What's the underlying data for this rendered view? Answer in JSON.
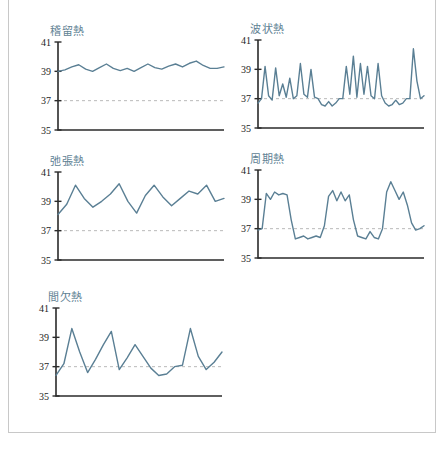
{
  "page": {
    "background_color": "#ffffff",
    "border_color": "#c8c8c8",
    "line_color": "#5a7f94",
    "title_color": "#5f8294",
    "axis_color": "#2b2b2b",
    "reference_line_color": "#b9b9b9"
  },
  "chart_data": [
    {
      "type": "line",
      "title": "稽留熱",
      "xlabel": "",
      "ylabel": "",
      "ylim": [
        35,
        41
      ],
      "yticks": [
        35,
        37,
        39,
        41
      ],
      "ytick_labels": [
        "35",
        "37",
        "39",
        "41"
      ],
      "grid": false,
      "legend": "none",
      "reference_line": 37,
      "series": [
        {
          "name": "体温",
          "values": [
            39.0,
            39.1,
            39.3,
            39.45,
            39.15,
            39.0,
            39.25,
            39.5,
            39.2,
            39.05,
            39.2,
            39.0,
            39.25,
            39.5,
            39.25,
            39.15,
            39.35,
            39.5,
            39.3,
            39.55,
            39.7,
            39.4,
            39.2,
            39.2,
            39.3
          ]
        }
      ]
    },
    {
      "type": "line",
      "title": "波状熱",
      "xlabel": "",
      "ylabel": "",
      "ylim": [
        35,
        41
      ],
      "yticks": [
        35,
        37,
        39,
        41
      ],
      "ytick_labels": [
        "35",
        "37",
        "39",
        "41"
      ],
      "grid": false,
      "legend": "none",
      "reference_line": 37,
      "series": [
        {
          "name": "体温",
          "values": [
            36.7,
            37.0,
            39.2,
            37.2,
            36.9,
            39.1,
            37.2,
            38.0,
            37.1,
            38.4,
            37.0,
            37.2,
            39.4,
            37.3,
            37.1,
            39.0,
            37.1,
            37.0,
            36.6,
            36.5,
            36.8,
            36.5,
            36.7,
            37.0,
            37.0,
            39.2,
            37.3,
            39.9,
            37.1,
            39.4,
            37.3,
            39.2,
            37.2,
            37.0,
            39.4,
            37.2,
            36.7,
            36.5,
            36.6,
            36.9,
            36.6,
            36.7,
            37.0,
            37.0,
            40.4,
            38.2,
            37.0,
            37.2
          ]
        }
      ]
    },
    {
      "type": "line",
      "title": "弛張熱",
      "xlabel": "",
      "ylabel": "",
      "ylim": [
        35,
        41
      ],
      "yticks": [
        35,
        37,
        39,
        41
      ],
      "ytick_labels": [
        "35",
        "37",
        "39",
        "41"
      ],
      "grid": false,
      "legend": "none",
      "reference_line": 37,
      "series": [
        {
          "name": "体温",
          "values": [
            38.1,
            38.8,
            40.1,
            39.2,
            38.6,
            39.0,
            39.5,
            40.2,
            39.0,
            38.2,
            39.4,
            40.1,
            39.3,
            38.7,
            39.2,
            39.7,
            39.5,
            40.1,
            39.0,
            39.2
          ]
        }
      ]
    },
    {
      "type": "line",
      "title": "周期熱",
      "xlabel": "",
      "ylabel": "",
      "ylim": [
        35,
        41
      ],
      "yticks": [
        35,
        37,
        39,
        41
      ],
      "ytick_labels": [
        "35",
        "37",
        "39",
        "41"
      ],
      "grid": false,
      "legend": "none",
      "reference_line": 37,
      "series": [
        {
          "name": "体温",
          "values": [
            36.9,
            37.0,
            39.4,
            39.0,
            39.5,
            39.3,
            39.4,
            39.3,
            37.6,
            36.3,
            36.4,
            36.5,
            36.3,
            36.4,
            36.5,
            36.4,
            37.2,
            39.2,
            39.6,
            38.9,
            39.5,
            38.9,
            39.3,
            37.6,
            36.5,
            36.4,
            36.3,
            36.8,
            36.4,
            36.3,
            37.0,
            39.5,
            40.2,
            39.6,
            39.0,
            39.5,
            38.6,
            37.4,
            36.9,
            37.0,
            37.2
          ]
        }
      ]
    },
    {
      "type": "line",
      "title": "間欠熱",
      "xlabel": "",
      "ylabel": "",
      "ylim": [
        35,
        41
      ],
      "yticks": [
        35,
        37,
        39,
        41
      ],
      "ytick_labels": [
        "35",
        "37",
        "39",
        "41"
      ],
      "grid": false,
      "legend": "none",
      "reference_line": 37,
      "series": [
        {
          "name": "体温",
          "values": [
            36.4,
            37.2,
            39.6,
            38.0,
            36.6,
            37.5,
            38.5,
            39.4,
            36.8,
            37.6,
            38.5,
            37.7,
            36.9,
            36.4,
            36.5,
            37.0,
            37.1,
            39.6,
            37.7,
            36.8,
            37.3,
            38.0
          ]
        }
      ]
    }
  ]
}
